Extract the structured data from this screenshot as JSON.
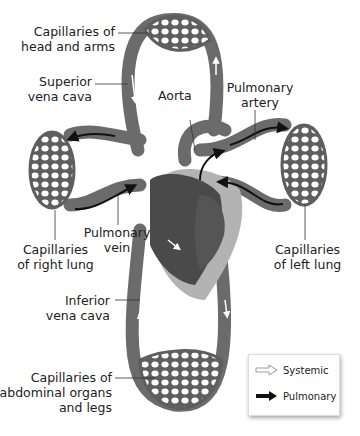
{
  "diagram": {
    "type": "circulatory-system",
    "labels": {
      "head_capillaries": [
        "Capillaries of",
        "head and arms"
      ],
      "superior_vena_cava": [
        "Superior",
        "vena cava"
      ],
      "aorta": "Aorta",
      "pulmonary_artery": [
        "Pulmonary",
        "artery"
      ],
      "pulmonary_vein": [
        "Pulmonary",
        "vein"
      ],
      "right_lung": [
        "Capillaries",
        "of right lung"
      ],
      "left_lung": [
        "Capillaries",
        "of left lung"
      ],
      "inferior_vena_cava": [
        "Inferior",
        "vena cava"
      ],
      "abdominal": [
        "Capillaries of",
        "abdominal organs",
        "and legs"
      ]
    },
    "legend": {
      "systemic": "Systemic",
      "pulmonary": "Pulmonary"
    },
    "colors": {
      "vessel": "#6b6b6b",
      "vessel_dark": "#4a4a4a",
      "heart_light": "#b3b3b3",
      "arrow_pulmonary": "#111111",
      "arrow_systemic": "#ffffff"
    }
  }
}
